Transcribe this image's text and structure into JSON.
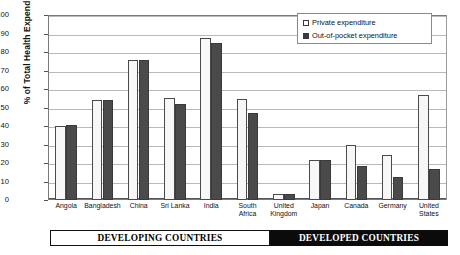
{
  "chart_data": {
    "type": "bar",
    "title": "",
    "subtitle": "",
    "xlabel": "",
    "ylabel": "% of Total Health Expenditure",
    "ylim": [
      0,
      100
    ],
    "ytick_step": 10,
    "yticks": [
      0,
      10,
      20,
      30,
      40,
      50,
      60,
      70,
      80,
      90,
      100
    ],
    "grid": true,
    "legend_position": "top-right",
    "categories": [
      "Angola",
      "Bangladesh",
      "China",
      "Sri Lanka",
      "India",
      "South Africa",
      "United Kingdom",
      "Japan",
      "Canada",
      "Germany",
      "United States"
    ],
    "series": [
      {
        "name": "Private expenditure",
        "color": "#f7f7f7",
        "border_color": "#4a4a4a",
        "values": [
          40.0,
          54.0,
          75.5,
          55.0,
          87.5,
          54.5,
          3.5,
          21.5,
          29.5,
          24.5,
          57.0
        ]
      },
      {
        "name": "Out-of-pocket expenditure",
        "color": "#4a4a4a",
        "border_color": "#3a3a3a",
        "values": [
          40.5,
          54.0,
          75.5,
          52.0,
          85.0,
          47.0,
          3.2,
          21.5,
          18.5,
          12.5,
          17.0
        ]
      }
    ],
    "annotations": [
      {
        "label": "DEVELOPING COUNTRIES",
        "group": [
          "Angola",
          "Bangladesh",
          "China",
          "Sri Lanka",
          "India",
          "South Africa"
        ]
      },
      {
        "label": "DEVELOPED COUNTRIES",
        "group": [
          "United Kingdom",
          "Japan",
          "Canada",
          "Germany",
          "United States"
        ]
      }
    ]
  },
  "legend": {
    "items": [
      {
        "label": "Private expenditure",
        "marker": "open-square-icon"
      },
      {
        "label": "Out-of-pocket expenditure",
        "marker": "filled-square-icon"
      }
    ]
  },
  "banners": {
    "developing": "DEVELOPING COUNTRIES",
    "developed": "DEVELOPED COUNTRIES"
  },
  "colors": {
    "private_fill": "#f7f7f7",
    "oop_fill": "#4a4a4a",
    "axis": "#555555",
    "grid": "#b9b9b9",
    "banner_developed_bg": "#0b0b0b",
    "banner_developing_bg": "#ffffff",
    "text": "#111111"
  }
}
